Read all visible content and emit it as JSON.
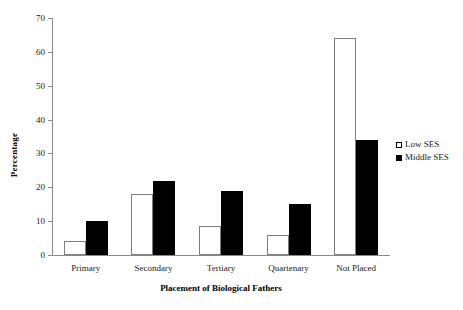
{
  "chart_data": {
    "type": "bar",
    "title": "",
    "xlabel": "Placement of Biological Fathers",
    "ylabel": "Percentage",
    "ylim": [
      0,
      70
    ],
    "yticks": [
      0,
      10,
      20,
      30,
      40,
      50,
      60,
      70
    ],
    "grid": false,
    "legend_position": "right",
    "categories": [
      "Primary",
      "Secondary",
      "Tertiary",
      "Quartenary",
      "Not Placed"
    ],
    "series": [
      {
        "name": "Low SES",
        "values": [
          4,
          18,
          8.5,
          6,
          64
        ],
        "color": "#ffffff",
        "edge": "#7d7d7d"
      },
      {
        "name": "Middle SES",
        "values": [
          10,
          22,
          19,
          15,
          34
        ],
        "color": "#000000",
        "edge": "#000000"
      }
    ]
  },
  "legend": {
    "items": [
      {
        "label": "Low SES",
        "marker": "hollow-square-icon"
      },
      {
        "label": "Middle SES",
        "marker": "filled-square-icon"
      }
    ]
  },
  "axes": {
    "y_title": "Percentage",
    "x_title": "Placement of Biological Fathers",
    "y_tick_labels": [
      "0",
      "10",
      "20",
      "30",
      "40",
      "50",
      "60",
      "70"
    ],
    "x_tick_labels": [
      "Primary",
      "Secondary",
      "Tertiary",
      "Quartenary",
      "Not Placed"
    ]
  }
}
